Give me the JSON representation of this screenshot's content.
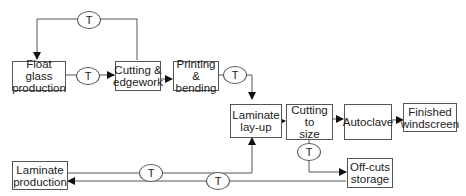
{
  "diagram": {
    "type": "process-flow",
    "nodes": {
      "float_glass": "Float glass\nproduction",
      "cutting_edgework": "Cutting &\nedgework",
      "printing_bending": "Printing &\nbending",
      "laminate_layup": "Laminate\nlay-up",
      "cutting_to_size": "Cutting to\nsize",
      "autoclave": "Autoclave",
      "finished_windscreen": "Finished\nwindscreen",
      "laminate_production": "Laminate\nproduction",
      "offcuts_storage": "Off-cuts\nstorage"
    },
    "transport_label": "T",
    "edges": [
      {
        "from": "Float glass production",
        "to": "Cutting & edgework",
        "via": "T"
      },
      {
        "from": "Cutting & edgework",
        "to": "Float glass production",
        "via": "T"
      },
      {
        "from": "Cutting & edgework",
        "to": "Printing & bending"
      },
      {
        "from": "Printing & bending",
        "to": "Laminate lay-up",
        "via": "T"
      },
      {
        "from": "Laminate lay-up",
        "to": "Cutting to size"
      },
      {
        "from": "Cutting to size",
        "to": "Autoclave"
      },
      {
        "from": "Autoclave",
        "to": "Finished windscreen"
      },
      {
        "from": "Laminate production",
        "to": "Laminate lay-up",
        "via": "T"
      },
      {
        "from": "Cutting to size",
        "to": "Off-cuts storage",
        "via": "T"
      },
      {
        "from": "Off-cuts storage",
        "to": "Laminate production",
        "via": "T"
      }
    ]
  }
}
